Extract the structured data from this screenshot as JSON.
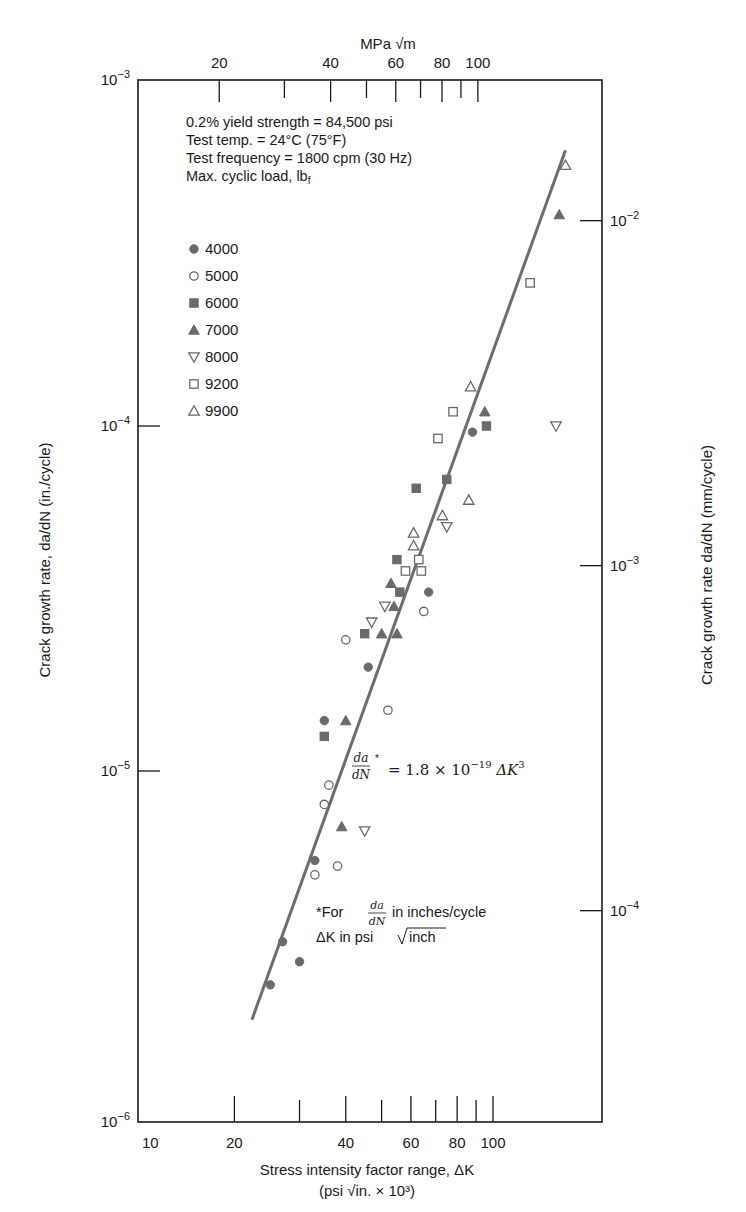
{
  "chart_data": {
    "type": "scatter",
    "x_scale": "log",
    "y_scale": "log",
    "xlabel": "Stress intensity factor range, ΔK",
    "xlabel_units": "(psi √in. × 10³)",
    "x_top_label": "MPa √m",
    "ylabel_left": "Crack growth rate, da/dN (in./cycle)",
    "ylabel_right": "Crack growth rate da/dN (mm/cycle)",
    "xlim": [
      11,
      181
    ],
    "ylim": [
      1e-06,
      0.001
    ],
    "x_ticks_bottom": [
      {
        "value": 10,
        "label": "10",
        "major": true
      },
      {
        "value": 20,
        "label": "20",
        "major": true
      },
      {
        "value": 30,
        "label": "",
        "major": false
      },
      {
        "value": 40,
        "label": "40",
        "major": true
      },
      {
        "value": 50,
        "label": "",
        "major": false
      },
      {
        "value": 60,
        "label": "60",
        "major": true
      },
      {
        "value": 70,
        "label": "",
        "major": false
      },
      {
        "value": 80,
        "label": "80",
        "major": true
      },
      {
        "value": 90,
        "label": "",
        "major": false
      },
      {
        "value": 100,
        "label": "100",
        "major": true
      }
    ],
    "x_ticks_top_mpa": [
      {
        "value": 20,
        "label": "20",
        "major": true
      },
      {
        "value": 30,
        "label": "",
        "major": false
      },
      {
        "value": 40,
        "label": "40",
        "major": true
      },
      {
        "value": 50,
        "label": "",
        "major": false
      },
      {
        "value": 60,
        "label": "60",
        "major": true
      },
      {
        "value": 70,
        "label": "",
        "major": false
      },
      {
        "value": 80,
        "label": "80",
        "major": true
      },
      {
        "value": 90,
        "label": "",
        "major": false
      },
      {
        "value": 100,
        "label": "100",
        "major": true
      }
    ],
    "mpa_per_ksi_sqrt_in": 1.0988,
    "y_ticks_left": [
      {
        "value": 0.001,
        "base": "10",
        "exp": "−3"
      },
      {
        "value": 0.0001,
        "base": "10",
        "exp": "−4"
      },
      {
        "value": 1e-05,
        "base": "10",
        "exp": "−5"
      },
      {
        "value": 1e-06,
        "base": "10",
        "exp": "−6"
      }
    ],
    "y_ticks_right_mm": [
      {
        "value": 0.01,
        "base": "10",
        "exp": "−2"
      },
      {
        "value": 0.001,
        "base": "10",
        "exp": "−3"
      },
      {
        "value": 0.0001,
        "base": "10",
        "exp": "−4"
      }
    ],
    "mm_per_in": 25.4,
    "grid": false,
    "legend_title": "Max. cyclic load, lbf",
    "legend_placement": "upper-left",
    "info_lines": [
      "0.2% yield strength = 84,500 psi",
      "Test temp. = 24°C (75°F)",
      "Test frequency = 1800 cpm (30 Hz)"
    ],
    "legend_title_main": "Max. cyclic load, lb",
    "legend_title_sub": "f",
    "equation": {
      "lhs": "da/dN *",
      "rhs_coef": "= 1.8 × 10",
      "rhs_exp": "−19",
      "rhs_var": " ΔK",
      "rhs_var_exp": "3",
      "coefficient": 1.8e-19,
      "exponent": 3
    },
    "footnote": {
      "line1_prefix": "*For",
      "line1_frac": "da/dN",
      "line1_suffix": "in inches/cycle",
      "line2_prefix": "ΔK in psi",
      "line2_root": "inch"
    },
    "fit_line": {
      "x": [
        22.3,
        157
      ],
      "y": [
        1.9e-06,
        0.00063
      ]
    },
    "series": [
      {
        "name": "4000",
        "marker": "circle",
        "filled": true,
        "x": [
          88,
          67,
          46,
          35,
          33,
          27,
          30,
          25
        ],
        "y": [
          9.6e-05,
          3.3e-05,
          2e-05,
          1.4e-05,
          5.5e-06,
          3.2e-06,
          2.8e-06,
          2.4e-06
        ]
      },
      {
        "name": "5000",
        "marker": "circle",
        "filled": false,
        "x": [
          65,
          40,
          52,
          36,
          35,
          38,
          33
        ],
        "y": [
          2.9e-05,
          2.4e-05,
          1.5e-05,
          9.1e-06,
          8e-06,
          5.3e-06,
          5e-06
        ]
      },
      {
        "name": "6000",
        "marker": "square",
        "filled": true,
        "x": [
          96,
          75,
          62,
          55,
          56,
          45,
          35
        ],
        "y": [
          0.0001,
          7e-05,
          6.6e-05,
          4.1e-05,
          3.3e-05,
          2.5e-05,
          1.26e-05
        ]
      },
      {
        "name": "7000",
        "marker": "triangle-up",
        "filled": true,
        "x": [
          151,
          95,
          53,
          54,
          50,
          55,
          40,
          39
        ],
        "y": [
          0.00041,
          0.00011,
          3.5e-05,
          3e-05,
          2.5e-05,
          2.5e-05,
          1.4e-05,
          6.9e-06
        ]
      },
      {
        "name": "8000",
        "marker": "triangle-down",
        "filled": false,
        "x": [
          148,
          75,
          51,
          47,
          45
        ],
        "y": [
          0.0001,
          5.1e-05,
          3e-05,
          2.7e-05,
          6.7e-06
        ]
      },
      {
        "name": "9200",
        "marker": "square",
        "filled": false,
        "x": [
          126,
          78,
          71,
          63,
          58,
          64
        ],
        "y": [
          0.00026,
          0.00011,
          9.2e-05,
          4.1e-05,
          3.8e-05,
          3.8e-05
        ]
      },
      {
        "name": "9900",
        "marker": "triangle-up",
        "filled": false,
        "x": [
          157,
          87,
          86,
          73,
          61,
          61
        ],
        "y": [
          0.00057,
          0.00013,
          6.1e-05,
          5.5e-05,
          4.9e-05,
          4.5e-05
        ]
      }
    ],
    "colors": {
      "ink": "#1a1a1a",
      "marker": "#6a6a6a",
      "line": "#6d6d6d"
    }
  }
}
